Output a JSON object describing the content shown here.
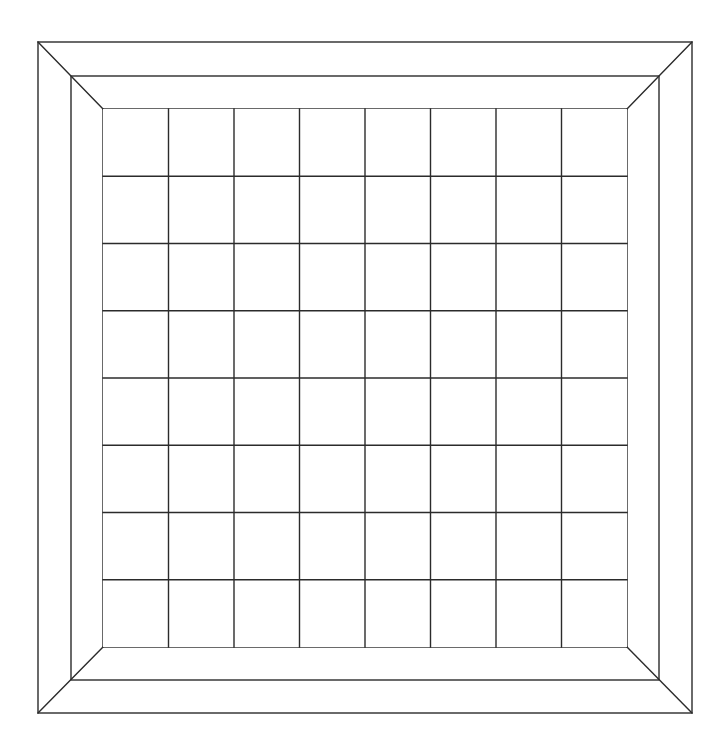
{
  "board": {
    "type": "chessboard",
    "rows": 8,
    "cols": 8,
    "line_color": "#2b2b2b",
    "background": "#ffffff",
    "frame": {
      "outer": {
        "x1": 38,
        "y1": 42,
        "x2": 692,
        "y2": 713
      },
      "middle": {
        "x1": 71,
        "y1": 76,
        "x2": 659,
        "y2": 680
      },
      "inner": {
        "x1": 103,
        "y1": 109,
        "x2": 627,
        "y2": 647
      }
    },
    "pieces": []
  }
}
